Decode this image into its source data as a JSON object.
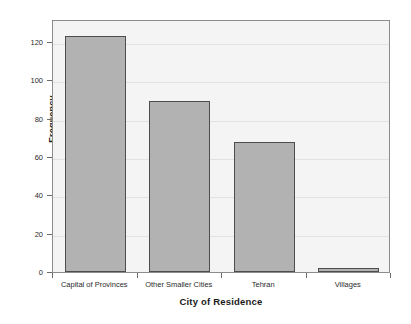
{
  "chart_data": {
    "type": "bar",
    "title": "",
    "xlabel": "City of Residence",
    "ylabel": "Frequency",
    "categories": [
      "Capital of Provinces",
      "Other Smaller Cities",
      "Tehran",
      "Villages"
    ],
    "values": [
      123,
      89,
      68,
      2
    ],
    "ylim": [
      0,
      132
    ],
    "yticks": [
      0,
      20,
      40,
      60,
      80,
      100,
      120
    ],
    "ytick_labels": [
      "0",
      "20",
      "40",
      "60",
      "80",
      "100",
      "120"
    ],
    "grid": "horizontal-faint",
    "legend": "none",
    "colors": {
      "bar_fill": "#b2b2b2",
      "bar_edge": "#4d4d4d",
      "plot_background": "#f4f4f4",
      "frame": "#8c8c8c",
      "gridline": "#e2e2e2",
      "text": "#1a1a1a"
    }
  }
}
